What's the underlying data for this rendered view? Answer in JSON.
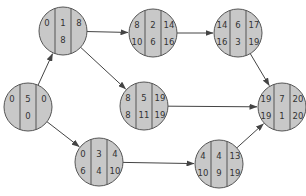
{
  "diagram": {
    "type": "activity-on-node network (critical path)",
    "colors": {
      "node_fill": "#c8c8c8",
      "node_stroke": "#555555",
      "edge": "#444444",
      "text": "#333333"
    },
    "nodes": [
      {
        "id": "start",
        "cx": 28,
        "cy": 107,
        "es": "0",
        "dur": "5",
        "ef": "0",
        "ls": "",
        "slack": "0",
        "lf": ""
      },
      {
        "id": "a",
        "cx": 63,
        "cy": 31,
        "es": "0",
        "dur": "1",
        "ef": "8",
        "ls": "",
        "slack": "8",
        "lf": ""
      },
      {
        "id": "b",
        "cx": 153,
        "cy": 33,
        "es": "8",
        "dur": "2",
        "ef": "14",
        "ls": "10",
        "slack": "6",
        "lf": "16"
      },
      {
        "id": "c",
        "cx": 238,
        "cy": 33,
        "es": "14",
        "dur": "6",
        "ef": "17",
        "ls": "16",
        "slack": "3",
        "lf": "19"
      },
      {
        "id": "d",
        "cx": 144,
        "cy": 106,
        "es": "8",
        "dur": "5",
        "ef": "19",
        "ls": "8",
        "slack": "11",
        "lf": "19"
      },
      {
        "id": "e",
        "cx": 99,
        "cy": 162,
        "es": "0",
        "dur": "3",
        "ef": "4",
        "ls": "6",
        "slack": "4",
        "lf": "10"
      },
      {
        "id": "f",
        "cx": 219,
        "cy": 164,
        "es": "4",
        "dur": "4",
        "ef": "13",
        "ls": "10",
        "slack": "9",
        "lf": "19"
      },
      {
        "id": "g",
        "cx": 282,
        "cy": 107,
        "es": "19",
        "dur": "7",
        "ef": "20",
        "ls": "19",
        "slack": "1",
        "lf": "20"
      }
    ],
    "edges": [
      {
        "from": "start",
        "to": "a"
      },
      {
        "from": "start",
        "to": "e"
      },
      {
        "from": "a",
        "to": "b"
      },
      {
        "from": "a",
        "to": "d"
      },
      {
        "from": "b",
        "to": "c"
      },
      {
        "from": "c",
        "to": "g"
      },
      {
        "from": "d",
        "to": "g"
      },
      {
        "from": "e",
        "to": "f"
      },
      {
        "from": "f",
        "to": "g"
      }
    ]
  }
}
